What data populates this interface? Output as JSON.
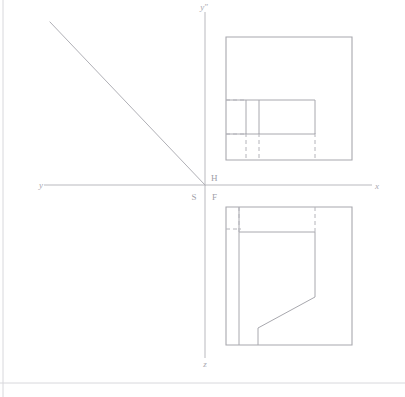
{
  "figure": {
    "kind": "orthographic-projection-diagram",
    "background_color": "#ffffff",
    "line_color": "#a8a8ae",
    "axis_color": "#b9b9be",
    "frame_color": "#d8d8dc",
    "width": 405,
    "height": 397
  },
  "axes": {
    "origin": {
      "x": 205,
      "y": 185
    },
    "vertical": {
      "x": 205,
      "y_top": 12,
      "y_bottom": 358
    },
    "horizontal": {
      "y": 185,
      "x_left": 44,
      "x_right": 372
    },
    "labels": {
      "y_axis_left": "y",
      "x_axis_right": "x",
      "y_double_prime_top": "y″",
      "z_axis_bottom": "z"
    },
    "label_positions": {
      "y_axis_left": {
        "x": 41,
        "y": 188
      },
      "x_axis_right": {
        "x": 377,
        "y": 189
      },
      "y_double_prime_top": {
        "x": 201,
        "y": 10
      },
      "z_axis_bottom": {
        "x": 203,
        "y": 366
      }
    }
  },
  "quadrant_labels": [
    {
      "text": "H",
      "x": 210,
      "y": 180,
      "name": "label-h-horizontal-plane"
    },
    {
      "text": "S",
      "x": 193,
      "y": 199,
      "name": "label-s-side-plane"
    },
    {
      "text": "F",
      "x": 211,
      "y": 199,
      "name": "label-f-frontal-plane"
    }
  ],
  "miter_line": {
    "name": "45-degree-miter-line",
    "x1": 50,
    "y1": 22,
    "x2": 205,
    "y2": 185
  },
  "top_view": {
    "name": "top-view",
    "bounds": {
      "left": 226,
      "top": 37,
      "right": 352,
      "bottom": 160
    },
    "outline": "M226,37 L352,37 L352,160 L226,160 Z",
    "solid_segments": [
      {
        "name": "inner-rect-top-edge",
        "x1": 226,
        "y1": 100,
        "x2": 315,
        "y2": 100
      },
      {
        "name": "inner-rect-bottom-edge",
        "x1": 226,
        "y1": 134,
        "x2": 315,
        "y2": 134
      },
      {
        "name": "inner-rect-right-edge",
        "x1": 315,
        "y1": 100,
        "x2": 315,
        "y2": 134
      },
      {
        "name": "inner-vertical-divider-a",
        "x1": 246,
        "y1": 100,
        "x2": 246,
        "y2": 134
      },
      {
        "name": "inner-vertical-divider-b",
        "x1": 259,
        "y1": 100,
        "x2": 259,
        "y2": 134
      }
    ],
    "hidden_segments": [
      {
        "name": "hidden-left-top",
        "x1": 226,
        "y1": 100,
        "x2": 246,
        "y2": 100
      },
      {
        "name": "hidden-left-bottom",
        "x1": 226,
        "y1": 134,
        "x2": 246,
        "y2": 134
      },
      {
        "name": "hidden-vert-a",
        "x1": 246,
        "y1": 134,
        "x2": 246,
        "y2": 160
      },
      {
        "name": "hidden-vert-b",
        "x1": 259,
        "y1": 134,
        "x2": 259,
        "y2": 160
      },
      {
        "name": "hidden-vert-c",
        "x1": 315,
        "y1": 134,
        "x2": 315,
        "y2": 160
      }
    ]
  },
  "front_view": {
    "name": "front-view",
    "bounds": {
      "left": 226,
      "top": 207,
      "right": 352,
      "bottom": 345
    },
    "outline": "M226,207 L352,207 L352,345 L226,345 Z",
    "solid_segments": [
      {
        "name": "upper-horizontal-edge",
        "x1": 226,
        "y1": 232,
        "x2": 315,
        "y2": 232
      },
      {
        "name": "left-inner-vertical",
        "x1": 239,
        "y1": 207,
        "x2": 239,
        "y2": 345
      },
      {
        "name": "step-vertical-right",
        "x1": 315,
        "y1": 232,
        "x2": 315,
        "y2": 297
      },
      {
        "name": "slope-edge",
        "x1": 315,
        "y1": 297,
        "x2": 258,
        "y2": 328
      },
      {
        "name": "step-vertical-lower",
        "x1": 258,
        "y1": 328,
        "x2": 258,
        "y2": 345
      }
    ],
    "hidden_segments": [
      {
        "name": "hidden-top-vert-a",
        "x1": 239,
        "y1": 207,
        "x2": 239,
        "y2": 232
      },
      {
        "name": "hidden-top-vert-b",
        "x1": 315,
        "y1": 207,
        "x2": 315,
        "y2": 232
      },
      {
        "name": "hidden-left-horizontal",
        "x1": 226,
        "y1": 228,
        "x2": 239,
        "y2": 228
      }
    ]
  },
  "page_frame": {
    "left_rule": {
      "x": 3,
      "y1": 0,
      "y2": 397
    },
    "bottom_rule": {
      "y": 383,
      "x1": 0,
      "x2": 405
    }
  }
}
